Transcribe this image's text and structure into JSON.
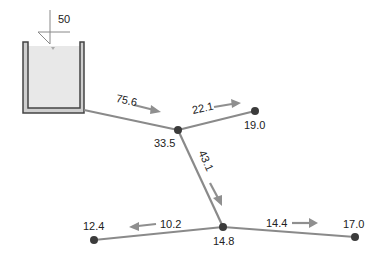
{
  "diagram": {
    "type": "pipe-network",
    "reservoir": {
      "inflow_label": "50",
      "water_color": "#e8e8e8",
      "wall_color": "#444444",
      "wall_fill": "#cfcfcf"
    },
    "nodes": [
      {
        "id": "A",
        "label": "33.5"
      },
      {
        "id": "B",
        "label": "19.0"
      },
      {
        "id": "C",
        "label": "14.8"
      },
      {
        "id": "D",
        "label": "12.4"
      },
      {
        "id": "E",
        "label": "17.0"
      }
    ],
    "pipes": [
      {
        "from": "reservoir",
        "to": "A",
        "flow_label": "75.6"
      },
      {
        "from": "A",
        "to": "B",
        "flow_label": "22.1"
      },
      {
        "from": "A",
        "to": "C",
        "flow_label": "43.1"
      },
      {
        "from": "C",
        "to": "D",
        "flow_label": "10.2"
      },
      {
        "from": "C",
        "to": "E",
        "flow_label": "14.4"
      }
    ],
    "colors": {
      "pipe": "#8a8a8a",
      "node": "#3b3b3b",
      "arrow": "#8f8f8f",
      "text": "#222222"
    }
  }
}
